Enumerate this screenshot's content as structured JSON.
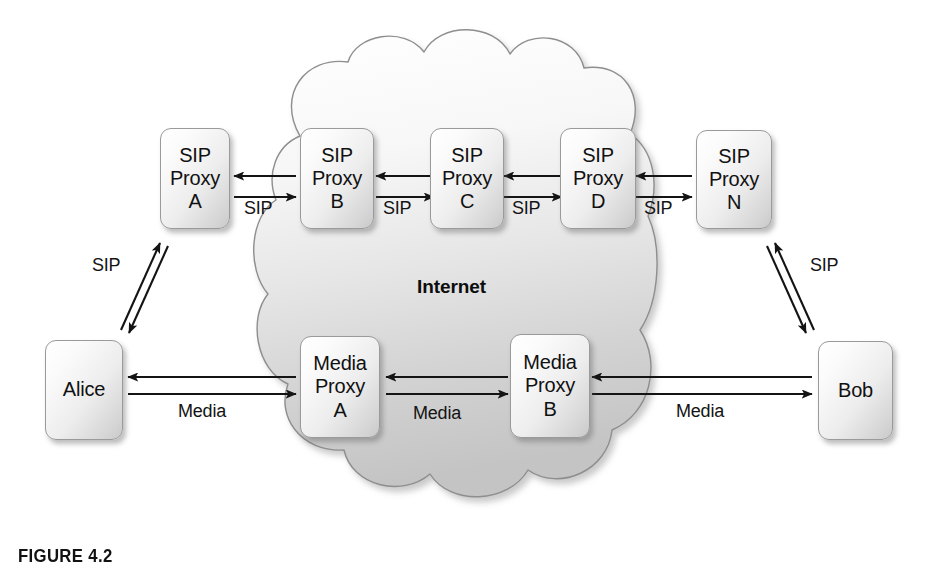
{
  "figure": {
    "caption": "FIGURE 4.2",
    "cloud_label": "Internet"
  },
  "nodes": [
    {
      "id": "sip-proxy-a",
      "lines": [
        "SIP",
        "Proxy",
        "A"
      ]
    },
    {
      "id": "sip-proxy-b",
      "lines": [
        "SIP",
        "Proxy",
        "B"
      ]
    },
    {
      "id": "sip-proxy-c",
      "lines": [
        "SIP",
        "Proxy",
        "C"
      ]
    },
    {
      "id": "sip-proxy-d",
      "lines": [
        "SIP",
        "Proxy",
        "D"
      ]
    },
    {
      "id": "sip-proxy-n",
      "lines": [
        "SIP",
        "Proxy",
        "N"
      ]
    },
    {
      "id": "alice",
      "lines": [
        "Alice"
      ]
    },
    {
      "id": "media-proxy-a",
      "lines": [
        "Media",
        "Proxy",
        "A"
      ]
    },
    {
      "id": "media-proxy-b",
      "lines": [
        "Media",
        "Proxy",
        "B"
      ]
    },
    {
      "id": "bob",
      "lines": [
        "Bob"
      ]
    }
  ],
  "edge_labels": {
    "alice_sip": "SIP",
    "sip_ab": "SIP",
    "sip_bc": "SIP",
    "sip_cd": "SIP",
    "sip_dn": "SIP",
    "bob_sip": "SIP",
    "media_alice": "Media",
    "media_ab": "Media",
    "media_bob": "Media"
  },
  "colors": {
    "cloud_fill_top": "#fbfbfb",
    "cloud_fill_bottom": "#c8c8c8",
    "cloud_stroke": "#8e8e8e",
    "box_border": "#9a9a9a",
    "arrow": "#141414",
    "text": "#111111",
    "background": "#ffffff"
  }
}
